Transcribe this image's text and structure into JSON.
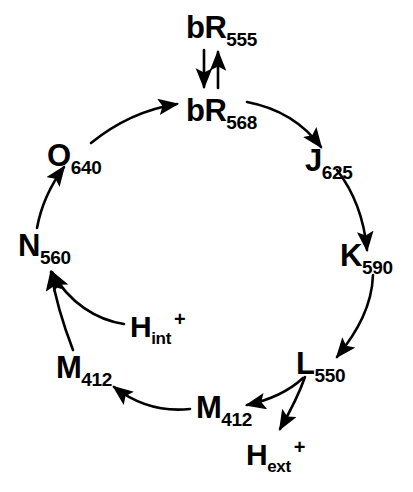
{
  "figure": {
    "background_color": "#ffffff",
    "stroke_color": "#000000",
    "width": 413,
    "height": 492
  },
  "nodes": [
    {
      "id": "bR555",
      "base": "bR",
      "sub": "555",
      "sup": "",
      "x": 186,
      "y": 12
    },
    {
      "id": "bR568",
      "base": "bR",
      "sub": "568",
      "sup": "",
      "x": 186,
      "y": 95
    },
    {
      "id": "J625",
      "base": "J",
      "sub": "625",
      "sup": "",
      "x": 305,
      "y": 145
    },
    {
      "id": "K590",
      "base": "K",
      "sub": "590",
      "sup": "",
      "x": 340,
      "y": 240
    },
    {
      "id": "L550",
      "base": "L",
      "sub": "550",
      "sup": "",
      "x": 296,
      "y": 348
    },
    {
      "id": "M412_bottom",
      "base": "M",
      "sub": "412",
      "sup": "",
      "x": 196,
      "y": 392
    },
    {
      "id": "Hext",
      "base": "H",
      "sub": "ext",
      "sup": "+",
      "x": 246,
      "y": 440
    },
    {
      "id": "M412_left",
      "base": "M",
      "sub": "412",
      "sup": "",
      "x": 56,
      "y": 352
    },
    {
      "id": "Hint",
      "base": "H",
      "sub": "int",
      "sup": "+",
      "x": 130,
      "y": 312
    },
    {
      "id": "N560",
      "base": "N",
      "sub": "560",
      "sup": "",
      "x": 18,
      "y": 230
    },
    {
      "id": "O640",
      "base": "O",
      "sub": "640",
      "sup": "",
      "x": 47,
      "y": 140
    }
  ],
  "transitions": [
    {
      "id": "bR568-to-bR555",
      "from": "bR568",
      "to": "bR555",
      "kind": "straight"
    },
    {
      "id": "bR555-to-bR568",
      "from": "bR555",
      "to": "bR568",
      "kind": "straight"
    },
    {
      "id": "bR568-to-J625",
      "from": "bR568",
      "to": "J625",
      "kind": "arc"
    },
    {
      "id": "J625-to-K590",
      "from": "J625",
      "to": "K590",
      "kind": "arc"
    },
    {
      "id": "K590-to-L550",
      "from": "K590",
      "to": "L550",
      "kind": "arc"
    },
    {
      "id": "L550-to-M412",
      "from": "L550",
      "to": "M412_bottom",
      "kind": "arc"
    },
    {
      "id": "L550-to-Hext",
      "from": "L550",
      "to": "Hext",
      "kind": "arc"
    },
    {
      "id": "M412-to-M412",
      "from": "M412_bottom",
      "to": "M412_left",
      "kind": "arc"
    },
    {
      "id": "M412-to-N560",
      "from": "M412_left",
      "to": "N560",
      "kind": "arc"
    },
    {
      "id": "Hint-to-N560",
      "from": "Hint",
      "to": "N560",
      "kind": "arc"
    },
    {
      "id": "N560-to-O640",
      "from": "N560",
      "to": "O640",
      "kind": "arc"
    },
    {
      "id": "O640-to-bR568",
      "from": "O640",
      "to": "bR568",
      "kind": "arc"
    }
  ]
}
